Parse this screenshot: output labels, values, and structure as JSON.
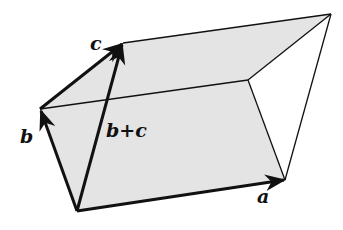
{
  "diagram": {
    "fill_color": "#e4e4e4",
    "stroke_color": "#111111",
    "vertices": {
      "origin": [
        77,
        211
      ],
      "a": [
        285,
        180
      ],
      "b": [
        40,
        109
      ],
      "b_plus_c": [
        123,
        43
      ],
      "a_plus_b": [
        248,
        80
      ],
      "a_plus_b_plus_c": [
        331,
        14
      ]
    },
    "labels": {
      "a": "a",
      "b": "b",
      "c": "c",
      "b_plus_c": "b+c"
    }
  }
}
